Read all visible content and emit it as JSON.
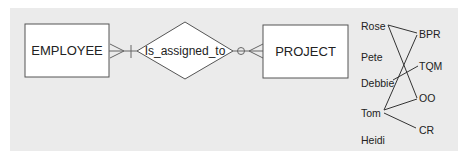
{
  "diagram": {
    "colors": {
      "panel_background": "#ebebeb",
      "page_background": "#ffffff",
      "box_fill": "#ffffff",
      "stroke": "#555555",
      "text": "#222222"
    },
    "entities": [
      {
        "id": "employee",
        "label": "EMPLOYEE"
      },
      {
        "id": "project",
        "label": "PROJECT"
      }
    ],
    "relationship": {
      "label": "Is_assigned_to",
      "employee_side_cardinality": "many-to-one (crow's foot + bar)",
      "project_side_cardinality": "zero-or-many (circle + crow's foot)"
    },
    "instances": {
      "employees": [
        "Rose",
        "Pete",
        "Debbie",
        "Tom",
        "Heidi"
      ],
      "projects": [
        "BPR",
        "TQM",
        "OO",
        "CR"
      ],
      "assignments": [
        {
          "employee": "Rose",
          "project": "BPR"
        },
        {
          "employee": "Rose",
          "project": "OO"
        },
        {
          "employee": "Debbie",
          "project": "TQM"
        },
        {
          "employee": "Tom",
          "project": "BPR"
        },
        {
          "employee": "Tom",
          "project": "OO"
        },
        {
          "employee": "Tom",
          "project": "CR"
        }
      ]
    }
  }
}
